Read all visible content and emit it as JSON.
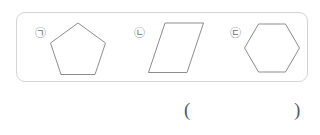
{
  "figure": {
    "name": "geometry-shape-figure",
    "border_color": "#d2d4d6",
    "stroke_color": "#8b8d90",
    "background_color": "#ffffff",
    "items": [
      {
        "label": "㉠",
        "label_icon": "circled-korean-giyeok-icon",
        "shape": "pentagon",
        "shape_icon": "pentagon-outline-icon",
        "sides": 5,
        "description": "regular pentagon, point up"
      },
      {
        "label": "㉡",
        "label_icon": "circled-korean-nieun-icon",
        "shape": "parallelogram",
        "shape_icon": "parallelogram-outline-icon",
        "sides": 4,
        "description": "parallelogram slanted to the right"
      },
      {
        "label": "㉢",
        "label_icon": "circled-korean-digeut-icon",
        "shape": "hexagon",
        "shape_icon": "hexagon-outline-icon",
        "sides": 6,
        "description": "regular hexagon, flat top and bottom"
      }
    ]
  },
  "answer": {
    "paren_open": "(",
    "paren_close": ")",
    "value": "",
    "placeholder": ""
  }
}
